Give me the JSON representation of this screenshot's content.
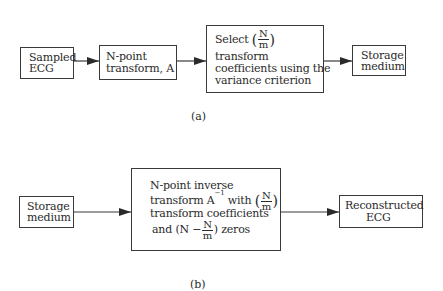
{
  "diagram_a": {
    "label": "(a)",
    "nodes": [
      {
        "id": "sampled-ecg",
        "lines": [
          "Sampled",
          "ECG"
        ]
      },
      {
        "id": "n-point-transform",
        "lines": [
          "N-point",
          "transform, A"
        ]
      },
      {
        "id": "select-coefficients",
        "line1_prefix": "Select",
        "fraction": {
          "num": "N",
          "den": "m"
        },
        "lines": [
          "transform",
          "coefficients using the",
          "variance criterion"
        ]
      },
      {
        "id": "storage-medium",
        "lines": [
          "Storage",
          "medium"
        ]
      }
    ],
    "edges": [
      [
        "sampled-ecg",
        "n-point-transform"
      ],
      [
        "n-point-transform",
        "select-coefficients"
      ],
      [
        "select-coefficients",
        "storage-medium"
      ]
    ]
  },
  "diagram_b": {
    "label": "(b)",
    "nodes": [
      {
        "id": "storage-medium",
        "lines": [
          "Storage",
          "medium"
        ]
      },
      {
        "id": "inverse-transform",
        "line1": "N-point inverse",
        "line2_prefix": "transform A",
        "line2_sup": "−1",
        "line2_mid": " with",
        "fraction": {
          "num": "N",
          "den": "m"
        },
        "line3": "transform coefficients",
        "line4_prefix": "and (N −",
        "line4_suffix": ") zeros"
      },
      {
        "id": "reconstructed-ecg",
        "lines": [
          "Reconstructed",
          "ECG"
        ]
      }
    ],
    "edges": [
      [
        "storage-medium",
        "inverse-transform"
      ],
      [
        "inverse-transform",
        "reconstructed-ecg"
      ]
    ]
  },
  "colors": {
    "stroke": "#3a3a3a",
    "text": "#2a2a2a",
    "background": "#ffffff"
  }
}
